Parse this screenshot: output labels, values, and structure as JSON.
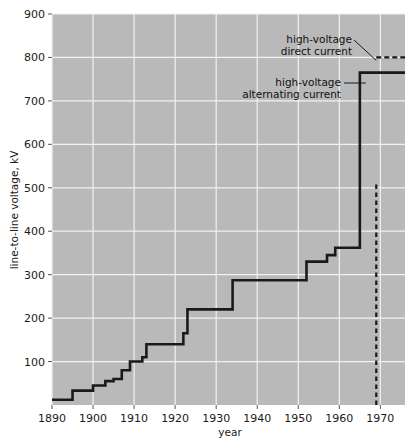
{
  "chart_data": {
    "type": "line",
    "title": "",
    "subtitle": "",
    "xlabel": "year",
    "ylabel": "line-to-line voltage, kV",
    "xlim": [
      1890,
      1976
    ],
    "ylim": [
      0,
      900
    ],
    "grid": true,
    "legend_position": "none",
    "x_ticks": [
      1890,
      1900,
      1910,
      1920,
      1930,
      1940,
      1950,
      1960,
      1970
    ],
    "x_tick_labels": [
      "1890",
      "1900",
      "1910",
      "1920",
      "1930",
      "1940",
      "1950",
      "1960",
      "1970"
    ],
    "y_ticks": [
      100,
      200,
      300,
      400,
      500,
      600,
      700,
      800,
      900
    ],
    "y_tick_labels": [
      "100",
      "200",
      "300",
      "400",
      "500",
      "600",
      "700",
      "800",
      "900"
    ],
    "series": [
      {
        "name": "high-voltage alternating current",
        "style": "step",
        "color": "#1a1a1a",
        "x": [
          1890,
          1895,
          1897,
          1900,
          1903,
          1905,
          1907,
          1908,
          1910,
          1912,
          1913,
          1922,
          1923,
          1934,
          1952,
          1953,
          1957,
          1959,
          1964,
          1965,
          1976
        ],
        "values": [
          12,
          12,
          33,
          33,
          50,
          57,
          60,
          80,
          85,
          105,
          110,
          140,
          150,
          165,
          220,
          220,
          287,
          287,
          345,
          362,
          362
        ],
        "steps": [
          {
            "year": 1890,
            "kv": 12
          },
          {
            "year": 1895,
            "kv": 33
          },
          {
            "year": 1900,
            "kv": 45
          },
          {
            "year": 1903,
            "kv": 55
          },
          {
            "year": 1905,
            "kv": 60
          },
          {
            "year": 1907,
            "kv": 80
          },
          {
            "year": 1909,
            "kv": 100
          },
          {
            "year": 1912,
            "kv": 110
          },
          {
            "year": 1913,
            "kv": 140
          },
          {
            "year": 1922,
            "kv": 165
          },
          {
            "year": 1923,
            "kv": 220
          },
          {
            "year": 1934,
            "kv": 287
          },
          {
            "year": 1952,
            "kv": 330
          },
          {
            "year": 1957,
            "kv": 345
          },
          {
            "year": 1959,
            "kv": 362
          },
          {
            "year": 1965,
            "kv": 500
          },
          {
            "year": 1965,
            "kv": 765
          }
        ]
      },
      {
        "name": "high-voltage direct current",
        "style": "dashed-horizontal",
        "color": "#1a1a1a",
        "x": [
          1969,
          1976
        ],
        "values": [
          800,
          800
        ]
      }
    ],
    "reference_lines": [
      {
        "name": "present-year-marker",
        "orientation": "vertical",
        "x": 1969,
        "style": "dashed"
      }
    ],
    "annotations": [
      {
        "id": "hvdc",
        "lines": [
          "high-voltage",
          "direct current"
        ],
        "text": "high-voltage direct current",
        "target_year": 1969,
        "target_kv": 800
      },
      {
        "id": "hvac",
        "lines": [
          "high-voltage",
          "alternating current"
        ],
        "text": "high-voltage alternating current",
        "target_year": 1966,
        "target_kv": 765
      }
    ],
    "colors": {
      "plot_background": "#b9b9b9",
      "grid": "#f2f2f2",
      "line": "#1a1a1a",
      "page_background": "#ffffff",
      "text": "#1a1a1a"
    }
  }
}
